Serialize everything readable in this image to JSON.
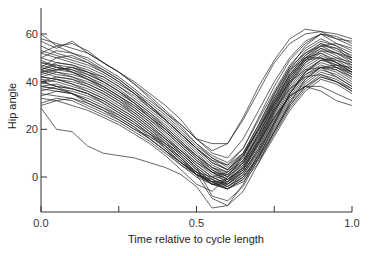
{
  "chart_data": {
    "type": "line",
    "title": "",
    "xlabel": "Time relative to cycle length",
    "ylabel": "Hip angle",
    "xlim": [
      0.0,
      1.0
    ],
    "ylim": [
      -15,
      70
    ],
    "x_ticks": [
      0.0,
      0.25,
      0.5,
      0.75,
      1.0
    ],
    "x_tick_labels": [
      "0.0",
      "",
      "0.5",
      "",
      "1.0"
    ],
    "y_ticks": [
      0,
      20,
      40,
      60
    ],
    "y_tick_labels": [
      "0",
      "20",
      "40",
      "60"
    ],
    "grid": false,
    "legend": null,
    "line_color": "#222222",
    "x": [
      0.0,
      0.05,
      0.1,
      0.15,
      0.2,
      0.25,
      0.3,
      0.35,
      0.4,
      0.45,
      0.5,
      0.55,
      0.6,
      0.65,
      0.7,
      0.75,
      0.8,
      0.85,
      0.9,
      0.95,
      1.0
    ],
    "series": [
      {
        "name": "curve-1",
        "values": [
          60,
          55,
          52,
          50,
          46,
          42,
          37,
          32,
          27,
          21,
          14,
          8,
          4,
          10,
          22,
          35,
          46,
          55,
          60,
          58,
          57
        ]
      },
      {
        "name": "curve-2",
        "values": [
          57,
          54,
          57,
          52,
          48,
          44,
          39,
          33,
          27,
          22,
          16,
          10,
          8,
          16,
          28,
          40,
          50,
          57,
          60,
          56,
          53
        ]
      },
      {
        "name": "curve-3",
        "values": [
          55,
          52,
          50,
          48,
          45,
          41,
          36,
          31,
          26,
          20,
          14,
          9,
          6,
          12,
          24,
          36,
          47,
          54,
          58,
          55,
          50
        ]
      },
      {
        "name": "curve-4",
        "values": [
          52,
          50,
          48,
          46,
          43,
          39,
          35,
          29,
          24,
          18,
          12,
          7,
          3,
          9,
          20,
          33,
          44,
          52,
          56,
          54,
          49
        ]
      },
      {
        "name": "curve-5",
        "values": [
          50,
          48,
          47,
          45,
          42,
          38,
          33,
          28,
          23,
          17,
          11,
          5,
          2,
          8,
          19,
          32,
          43,
          51,
          55,
          52,
          48
        ]
      },
      {
        "name": "curve-6",
        "values": [
          49,
          46,
          45,
          43,
          40,
          36,
          32,
          27,
          22,
          16,
          10,
          4,
          1,
          7,
          18,
          31,
          42,
          50,
          54,
          51,
          47
        ]
      },
      {
        "name": "curve-7",
        "values": [
          48,
          47,
          44,
          42,
          39,
          35,
          31,
          26,
          21,
          15,
          9,
          4,
          0,
          5,
          16,
          29,
          41,
          49,
          53,
          50,
          46
        ]
      },
      {
        "name": "curve-8",
        "values": [
          47,
          45,
          46,
          44,
          40,
          36,
          31,
          25,
          20,
          14,
          8,
          3,
          0,
          6,
          17,
          30,
          40,
          48,
          52,
          49,
          45
        ]
      },
      {
        "name": "curve-9",
        "values": [
          46,
          44,
          43,
          41,
          38,
          34,
          30,
          25,
          19,
          13,
          7,
          2,
          -1,
          4,
          15,
          28,
          39,
          47,
          51,
          48,
          44
        ]
      },
      {
        "name": "curve-10",
        "values": [
          45,
          48,
          47,
          44,
          41,
          37,
          32,
          27,
          21,
          15,
          9,
          3,
          -1,
          3,
          14,
          27,
          38,
          46,
          50,
          48,
          45
        ]
      },
      {
        "name": "curve-11",
        "values": [
          45,
          43,
          42,
          40,
          37,
          33,
          29,
          24,
          18,
          12,
          6,
          1,
          -2,
          3,
          13,
          26,
          37,
          45,
          49,
          47,
          43
        ]
      },
      {
        "name": "curve-12",
        "values": [
          44,
          46,
          45,
          42,
          38,
          34,
          29,
          24,
          19,
          13,
          7,
          2,
          -2,
          2,
          12,
          25,
          36,
          44,
          48,
          46,
          42
        ]
      },
      {
        "name": "curve-13",
        "values": [
          44,
          42,
          41,
          39,
          36,
          32,
          28,
          23,
          17,
          11,
          5,
          0,
          -3,
          2,
          12,
          24,
          35,
          43,
          47,
          45,
          41
        ]
      },
      {
        "name": "curve-14",
        "values": [
          43,
          45,
          44,
          41,
          37,
          33,
          28,
          23,
          17,
          11,
          5,
          0,
          -3,
          1,
          11,
          23,
          34,
          42,
          46,
          44,
          40
        ]
      },
      {
        "name": "curve-15",
        "values": [
          42,
          41,
          40,
          38,
          35,
          31,
          27,
          22,
          16,
          10,
          4,
          -1,
          -4,
          1,
          10,
          22,
          33,
          41,
          46,
          45,
          42
        ]
      },
      {
        "name": "curve-16",
        "values": [
          42,
          44,
          42,
          39,
          36,
          32,
          27,
          22,
          16,
          10,
          4,
          -1,
          -4,
          0,
          9,
          21,
          32,
          40,
          45,
          43,
          39
        ]
      },
      {
        "name": "curve-17",
        "values": [
          41,
          40,
          38,
          36,
          33,
          29,
          25,
          20,
          15,
          9,
          3,
          -2,
          -5,
          0,
          9,
          20,
          31,
          39,
          44,
          42,
          38
        ]
      },
      {
        "name": "curve-18",
        "values": [
          40,
          42,
          41,
          38,
          35,
          31,
          26,
          21,
          15,
          9,
          3,
          -2,
          -5,
          -1,
          8,
          19,
          30,
          38,
          43,
          41,
          37
        ]
      },
      {
        "name": "curve-19",
        "values": [
          40,
          38,
          37,
          35,
          32,
          28,
          24,
          19,
          14,
          8,
          2,
          -3,
          -5,
          -1,
          7,
          18,
          29,
          37,
          42,
          40,
          36
        ]
      },
      {
        "name": "curve-20",
        "values": [
          39,
          41,
          39,
          36,
          33,
          29,
          25,
          20,
          14,
          8,
          2,
          -3,
          -5,
          -2,
          6,
          17,
          28,
          36,
          41,
          39,
          35
        ]
      },
      {
        "name": "curve-21",
        "values": [
          38,
          37,
          36,
          34,
          31,
          27,
          23,
          18,
          13,
          7,
          1,
          -3,
          -4,
          0,
          8,
          19,
          30,
          38,
          42,
          40,
          37
        ]
      },
      {
        "name": "curve-22",
        "values": [
          38,
          39,
          37,
          35,
          32,
          28,
          24,
          19,
          13,
          7,
          2,
          -2,
          -3,
          2,
          11,
          23,
          35,
          44,
          49,
          50,
          48
        ]
      },
      {
        "name": "curve-23",
        "values": [
          37,
          36,
          35,
          33,
          30,
          26,
          22,
          17,
          12,
          6,
          1,
          -3,
          -3,
          3,
          14,
          27,
          39,
          48,
          53,
          52,
          50
        ]
      },
      {
        "name": "curve-24",
        "values": [
          36,
          38,
          37,
          35,
          31,
          27,
          23,
          18,
          12,
          6,
          1,
          -2,
          -2,
          5,
          16,
          29,
          41,
          50,
          55,
          54,
          51
        ]
      },
      {
        "name": "curve-25",
        "values": [
          35,
          34,
          33,
          31,
          28,
          25,
          21,
          16,
          11,
          6,
          1,
          -2,
          -1,
          6,
          18,
          31,
          43,
          51,
          56,
          53,
          50
        ]
      },
      {
        "name": "curve-26",
        "values": [
          34,
          36,
          35,
          32,
          29,
          25,
          21,
          16,
          11,
          5,
          0,
          -3,
          -2,
          4,
          15,
          28,
          40,
          49,
          54,
          52,
          49
        ]
      },
      {
        "name": "curve-27",
        "values": [
          33,
          32,
          33,
          30,
          27,
          24,
          20,
          16,
          11,
          6,
          2,
          0,
          2,
          9,
          20,
          33,
          45,
          53,
          57,
          55,
          52
        ]
      },
      {
        "name": "curve-28",
        "values": [
          31,
          33,
          32,
          29,
          26,
          23,
          19,
          15,
          10,
          5,
          1,
          -1,
          1,
          7,
          18,
          30,
          42,
          50,
          52,
          48,
          44
        ]
      },
      {
        "name": "curve-29",
        "values": [
          46,
          50,
          51,
          48,
          44,
          40,
          35,
          30,
          25,
          19,
          13,
          8,
          5,
          12,
          25,
          38,
          49,
          56,
          60,
          59,
          56
        ]
      },
      {
        "name": "curve-30",
        "values": [
          50,
          53,
          52,
          49,
          45,
          41,
          36,
          30,
          24,
          18,
          12,
          6,
          3,
          10,
          22,
          35,
          46,
          52,
          55,
          56,
          54
        ]
      },
      {
        "name": "curve-31",
        "values": [
          53,
          51,
          49,
          47,
          44,
          40,
          35,
          30,
          24,
          18,
          12,
          6,
          3,
          9,
          21,
          34,
          45,
          50,
          50,
          47,
          44
        ]
      },
      {
        "name": "curve-32",
        "values": [
          44,
          45,
          46,
          44,
          42,
          38,
          34,
          29,
          24,
          18,
          12,
          7,
          5,
          10,
          20,
          31,
          40,
          45,
          46,
          42,
          38
        ]
      },
      {
        "name": "curve-33",
        "values": [
          48,
          46,
          44,
          41,
          38,
          34,
          30,
          25,
          20,
          14,
          9,
          4,
          2,
          7,
          17,
          28,
          37,
          42,
          43,
          40,
          36
        ]
      },
      {
        "name": "curve-34",
        "values": [
          42,
          41,
          39,
          37,
          34,
          30,
          26,
          21,
          16,
          11,
          6,
          2,
          1,
          6,
          15,
          25,
          34,
          38,
          38,
          35,
          32
        ]
      },
      {
        "name": "curve-35",
        "values": [
          45,
          47,
          46,
          43,
          40,
          36,
          31,
          26,
          20,
          14,
          8,
          2,
          -1,
          4,
          14,
          25,
          34,
          38,
          36,
          32,
          30
        ]
      },
      {
        "name": "curve-36",
        "values": [
          52,
          55,
          56,
          53,
          48,
          44,
          40,
          35,
          30,
          24,
          16,
          14,
          14,
          25,
          38,
          49,
          58,
          62,
          61,
          58,
          55
        ]
      },
      {
        "name": "curve-37",
        "values": [
          58,
          56,
          54,
          52,
          48,
          44,
          39,
          34,
          28,
          22,
          16,
          11,
          14,
          24,
          36,
          48,
          56,
          60,
          61,
          60,
          58
        ]
      },
      {
        "name": "curve-38",
        "values": [
          40,
          38,
          35,
          32,
          29,
          26,
          22,
          18,
          14,
          10,
          4,
          -8,
          -10,
          -4,
          8,
          22,
          35,
          44,
          49,
          49,
          47
        ]
      },
      {
        "name": "curve-39",
        "values": [
          38,
          37,
          35,
          31,
          28,
          24,
          20,
          17,
          13,
          8,
          1,
          -9,
          -12,
          -6,
          6,
          19,
          31,
          41,
          46,
          47,
          46
        ]
      },
      {
        "name": "curve-40",
        "values": [
          29,
          20,
          19,
          13,
          10,
          9,
          8,
          6,
          4,
          1,
          -4,
          -13,
          -12,
          -3,
          10,
          23,
          35,
          43,
          46,
          46,
          44
        ]
      },
      {
        "name": "curve-41",
        "values": [
          30,
          32,
          30,
          28,
          25,
          22,
          18,
          14,
          9,
          3,
          -3,
          -6,
          0,
          9,
          20,
          32,
          43,
          49,
          50,
          46,
          43
        ]
      }
    ]
  },
  "axes": {
    "x_title": "Time relative to cycle length",
    "y_title": "Hip angle"
  }
}
